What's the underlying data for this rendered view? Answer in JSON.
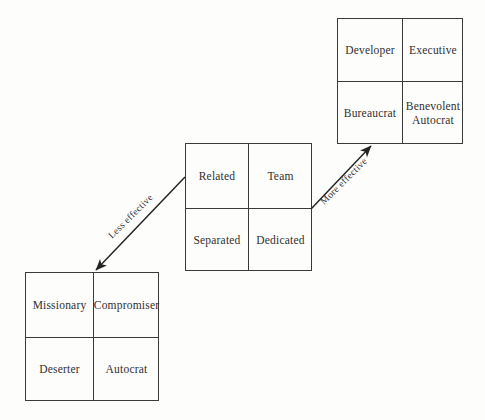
{
  "figure": {
    "background_color": "#fdfdfb",
    "line_color": "#3a3a3a",
    "text_color": "#303030"
  },
  "grids": {
    "top_right": {
      "name": "top-right-quadrant",
      "cells": {
        "top_left": "Developer",
        "top_right": "Executive",
        "bottom_left": "Bureaucrat",
        "bottom_right": "Benevolent\nAutocrat"
      }
    },
    "middle": {
      "name": "middle-quadrant",
      "cells": {
        "top_left": "Related",
        "top_right": "Team",
        "bottom_left": "Separated",
        "bottom_right": "Dedicated"
      }
    },
    "bottom_left": {
      "name": "bottom-left-quadrant",
      "cells": {
        "top_left": "Missionary",
        "top_right": "Compromiser",
        "bottom_left": "Deserter",
        "bottom_right": "Autocrat"
      }
    }
  },
  "arrows": [
    {
      "label": "Less effective",
      "direction": "down-left",
      "from": "middle-quadrant",
      "to": "bottom-left-quadrant"
    },
    {
      "label": "More effective",
      "direction": "up-right",
      "from": "middle-quadrant",
      "to": "top-right-quadrant"
    }
  ]
}
